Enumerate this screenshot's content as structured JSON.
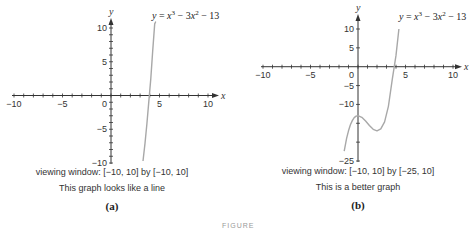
{
  "chart_data": [
    {
      "type": "line",
      "panel": "(a)",
      "title": "y = x^3 - 3x^2 - 13",
      "equation": {
        "lhs": "y",
        "rhs_parts": [
          "x",
          "3",
          " − 3",
          "x",
          "2",
          " − 13"
        ]
      },
      "xlabel": "x",
      "ylabel": "y",
      "xlim": [
        -10,
        10
      ],
      "ylim": [
        -10,
        10
      ],
      "x_ticks": [
        -10,
        -5,
        0,
        5,
        10
      ],
      "y_ticks": [
        -10,
        -5,
        5,
        10
      ],
      "x": [
        3.3,
        3.5,
        3.7,
        3.9,
        4.1,
        4.3,
        4.5,
        4.6,
        4.65
      ],
      "y": [
        -9.7,
        -7.1,
        -4.2,
        -0.9,
        2.5,
        6.6,
        10.6,
        13.0,
        14.2
      ],
      "viewing_window": "viewing window: [−10, 10] by [−10, 10]",
      "comment": "This graph looks like a line",
      "grid": false
    },
    {
      "type": "line",
      "panel": "(b)",
      "title": "y = x^3 - 3x^2 - 13",
      "equation": {
        "lhs": "y",
        "rhs_parts": [
          "x",
          "3",
          " − 3",
          "x",
          "2",
          " − 13"
        ]
      },
      "xlabel": "x",
      "ylabel": "y",
      "xlim": [
        -10,
        10
      ],
      "ylim": [
        -25,
        10
      ],
      "x_ticks": [
        -10,
        -5,
        0,
        5,
        10
      ],
      "y_ticks": [
        -25,
        -10,
        -5,
        5,
        10
      ],
      "x": [
        -1.45,
        -1.2,
        -1.0,
        -0.8,
        -0.6,
        -0.4,
        -0.2,
        0.0,
        0.4,
        0.8,
        1.2,
        1.6,
        2.0,
        2.4,
        2.8,
        3.2,
        3.6,
        4.0,
        4.3
      ],
      "y": [
        -22.4,
        -19.0,
        -17.0,
        -15.4,
        -14.3,
        -13.5,
        -13.1,
        -13.0,
        -13.4,
        -14.4,
        -15.6,
        -16.6,
        -17.0,
        -16.5,
        -14.6,
        -10.5,
        -3.5,
        3.0,
        10.0
      ],
      "viewing_window": "viewing window: [−10, 10] by [−25, 10]",
      "comment": "This is a better graph",
      "grid": false
    }
  ],
  "colors": {
    "axis": "#333333",
    "curve": "#a8a8a8",
    "text": "#222222"
  },
  "figure_label": "FIGURE"
}
